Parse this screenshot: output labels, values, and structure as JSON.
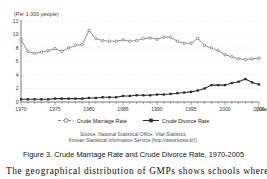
{
  "chart_data": {
    "type": "line",
    "title": "",
    "unit_label": "(Per 1,000 people)",
    "xlabel": "(Year)",
    "ylabel": "",
    "grid": true,
    "legend_position": "bottom",
    "xlim": [
      1970,
      2005
    ],
    "ylim": [
      0,
      12
    ],
    "yticks": [
      0,
      2,
      4,
      6,
      8,
      10,
      12
    ],
    "ytick_labels": [
      "0",
      "2",
      "4",
      "6",
      "8",
      "10",
      "12"
    ],
    "xticks": [
      1970,
      1975,
      1980,
      1985,
      1990,
      1995,
      2000,
      2005
    ],
    "xtick_labels": [
      "1970",
      "1975",
      "1980",
      "1985",
      "1990",
      "1995",
      "2000",
      "2005"
    ],
    "x": [
      1970,
      1971,
      1972,
      1973,
      1974,
      1975,
      1976,
      1977,
      1978,
      1979,
      1980,
      1981,
      1982,
      1983,
      1984,
      1985,
      1986,
      1987,
      1988,
      1989,
      1990,
      1991,
      1992,
      1993,
      1994,
      1995,
      1996,
      1997,
      1998,
      1999,
      2000,
      2001,
      2002,
      2003,
      2004,
      2005
    ],
    "series": [
      {
        "name": "Crude Marriage Rate",
        "marker": "open-circle",
        "color": "#6b6b6b",
        "values": [
          9.2,
          7.5,
          7.2,
          7.4,
          7.6,
          7.9,
          7.5,
          8.0,
          8.4,
          8.5,
          10.6,
          9.4,
          9.1,
          9.0,
          9.0,
          9.2,
          9.0,
          9.1,
          9.4,
          9.5,
          9.3,
          9.6,
          9.6,
          9.0,
          8.7,
          8.7,
          9.4,
          8.4,
          8.0,
          7.6,
          7.0,
          6.7,
          6.4,
          6.3,
          6.4,
          6.5
        ]
      },
      {
        "name": "Crude Divorce Rate",
        "marker": "filled-square",
        "color": "#2b2b2b",
        "values": [
          0.4,
          0.4,
          0.4,
          0.4,
          0.4,
          0.5,
          0.5,
          0.5,
          0.5,
          0.5,
          0.6,
          0.6,
          0.7,
          0.7,
          0.7,
          0.9,
          0.9,
          1.0,
          1.0,
          1.0,
          1.1,
          1.1,
          1.2,
          1.3,
          1.4,
          1.5,
          1.7,
          2.0,
          2.5,
          2.5,
          2.5,
          2.8,
          3.0,
          3.4,
          2.9,
          2.6
        ]
      }
    ]
  },
  "legend": {
    "items": [
      {
        "label": "Crude Marriage Rate"
      },
      {
        "label": "Crude Divorce Rate"
      }
    ]
  },
  "source": {
    "line1": "Source: National Statistical Office, Vital Statistics,",
    "line2": "Korean Statistical Information Service (http://www.kosis.kr/)."
  },
  "caption": {
    "text": "Figure 3. Crude Marriage Rate and Crude Divorce Rate, 1970-2005"
  },
  "body_text": {
    "line": "The geographical distribution of GMPs shows schools where"
  }
}
